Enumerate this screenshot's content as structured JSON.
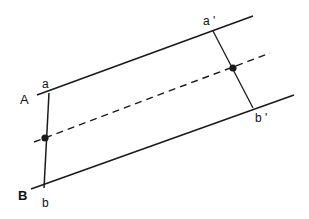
{
  "diagram": {
    "labels": {
      "A": "A",
      "a": "a",
      "B": "B",
      "b": "b",
      "a_prime": "a '",
      "b_prime": "b '"
    },
    "lines": {
      "upper_boundary": {
        "x1": 37,
        "y1": 95,
        "x2": 253,
        "y2": 16
      },
      "lower_boundary": {
        "x1": 31,
        "y1": 189,
        "x2": 294,
        "y2": 95
      },
      "center_dashed": {
        "x1": 34,
        "y1": 142,
        "x2": 270,
        "y2": 53
      },
      "left_transect": {
        "x1": 49,
        "y1": 93,
        "x2": 44,
        "y2": 188
      },
      "right_transect": {
        "x1": 213,
        "y1": 31,
        "x2": 253,
        "y2": 108
      }
    },
    "points": {
      "left_midpoint": {
        "cx": 45,
        "cy": 138
      },
      "right_midpoint": {
        "cx": 233,
        "cy": 68
      }
    },
    "colors": {
      "stroke": "#1a1a1a",
      "background": "#ffffff"
    }
  }
}
